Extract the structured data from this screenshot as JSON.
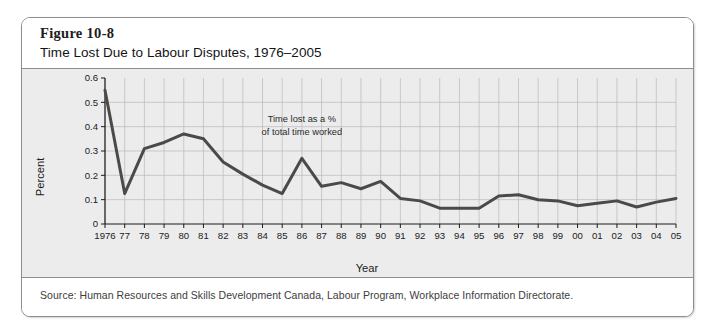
{
  "figure": {
    "number": "Figure 10-8",
    "title": "Time Lost Due to Labour Disputes, 1976–2005",
    "source": "Source: Human Resources and Skills Development Canada, Labour Program, Workplace Information Directorate."
  },
  "colors": {
    "frame_border": "#8d8d8d",
    "plot_background": "#ececed",
    "footer_background": "#ffffff",
    "line": "#4a4a4a",
    "grid": "#b9b9bd",
    "axis": "#1b1b1b"
  },
  "chart_data": {
    "type": "line",
    "title": "Time Lost Due to Labour Disputes, 1976–2005",
    "xlabel": "Year",
    "ylabel": "Percent",
    "xlim": [
      1976,
      2005
    ],
    "ylim": [
      0,
      0.6
    ],
    "yticks": [
      0,
      0.1,
      0.2,
      0.3,
      0.4,
      0.5,
      0.6
    ],
    "ytick_labels": [
      "0",
      "0.1",
      "0.2",
      "0.3",
      "0.4",
      "0.5",
      "0.6"
    ],
    "grid": "both",
    "legend": "none",
    "annotations": [
      {
        "text_line1": "Time lost as a %",
        "text_line2": "of total time worked",
        "x": 1986,
        "y": 0.42
      }
    ],
    "categories": [
      1976,
      1977,
      1978,
      1979,
      1980,
      1981,
      1982,
      1983,
      1984,
      1985,
      1986,
      1987,
      1988,
      1989,
      1990,
      1991,
      1992,
      1993,
      1994,
      1995,
      1996,
      1997,
      1998,
      1999,
      2000,
      2001,
      2002,
      2003,
      2004,
      2005
    ],
    "xtick_labels": [
      "1976",
      "77",
      "78",
      "79",
      "80",
      "81",
      "82",
      "83",
      "84",
      "85",
      "86",
      "87",
      "88",
      "89",
      "90",
      "91",
      "92",
      "93",
      "94",
      "95",
      "96",
      "97",
      "98",
      "99",
      "00",
      "01",
      "02",
      "03",
      "04",
      "05"
    ],
    "series": [
      {
        "name": "Time lost as a % of total time worked",
        "values": [
          0.55,
          0.125,
          0.31,
          0.335,
          0.37,
          0.35,
          0.255,
          0.205,
          0.16,
          0.125,
          0.27,
          0.155,
          0.17,
          0.145,
          0.175,
          0.105,
          0.095,
          0.065,
          0.065,
          0.065,
          0.115,
          0.12,
          0.1,
          0.095,
          0.075,
          0.085,
          0.095,
          0.07,
          0.09,
          0.105
        ]
      }
    ]
  }
}
